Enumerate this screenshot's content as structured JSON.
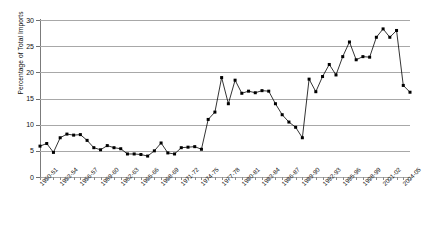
{
  "chart_data": {
    "type": "line",
    "title": "",
    "xlabel": "",
    "ylabel": "Percentage of Total Imports",
    "ylim": [
      0,
      30
    ],
    "yticks": [
      0,
      5,
      10,
      15,
      20,
      25,
      30
    ],
    "grid": true,
    "legend": "none",
    "marker": "square",
    "line_color": "#000000",
    "grid_color": "#a8a8a8",
    "axis_color": "#7b7b7b",
    "categories": [
      "1950-51",
      "1951-52",
      "1952-53",
      "1953-54",
      "1954-55",
      "1955-56",
      "1956-57",
      "1957-58",
      "1958-59",
      "1959-60",
      "1960-61",
      "1961-62",
      "1962-63",
      "1963-64",
      "1964-65",
      "1965-66",
      "1966-67",
      "1967-68",
      "1968-69",
      "1969-70",
      "1970-71",
      "1971-72",
      "1972-73",
      "1973-74",
      "1974-75",
      "1975-76",
      "1976-77",
      "1977-78",
      "1978-79",
      "1979-80",
      "1980-81",
      "1981-82",
      "1982-83",
      "1983-84",
      "1984-85",
      "1985-86",
      "1986-87",
      "1987-88",
      "1988-89",
      "1989-90",
      "1990-91",
      "1991-92",
      "1992-93",
      "1993-94",
      "1994-95",
      "1995-96",
      "1996-97",
      "1997-98",
      "1998-99",
      "1999-00",
      "2000-01",
      "2001-02",
      "2002-03",
      "2003-04",
      "2004-05",
      "2005-06"
    ],
    "tick_labels": [
      "1950-51",
      "1953-54",
      "1956-57",
      "1959-60",
      "1962-63",
      "1965-66",
      "1968-69",
      "1971-72",
      "1974-75",
      "1977-78",
      "1980-81",
      "1983-84",
      "1986-87",
      "1989-90",
      "1992-93",
      "1995-96",
      "1998-99",
      "2001-02",
      "2004-05"
    ],
    "tick_label_every": 3,
    "values": [
      5.9,
      6.4,
      4.7,
      7.5,
      8.2,
      8.0,
      8.1,
      7.0,
      5.6,
      5.2,
      6.0,
      5.6,
      5.4,
      4.4,
      4.4,
      4.3,
      4.0,
      5.0,
      6.5,
      4.6,
      4.4,
      5.6,
      5.7,
      5.8,
      5.3,
      11.0,
      12.4,
      19.0,
      14.0,
      18.5,
      16.0,
      16.4,
      16.1,
      16.5,
      16.4,
      14.0,
      11.9,
      10.5,
      9.5,
      7.5,
      18.7,
      16.3,
      19.2,
      21.5,
      19.5,
      23.0,
      25.8,
      22.4,
      23.0,
      22.9,
      26.7,
      28.3,
      26.7,
      28.0,
      17.5,
      16.2
    ]
  }
}
